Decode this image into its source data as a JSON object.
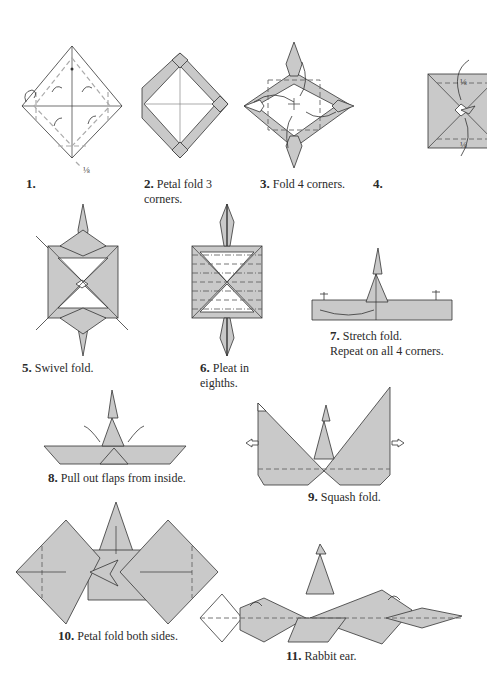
{
  "diagram": {
    "colors": {
      "paper_colored": "#c9c9c9",
      "paper_white": "#ffffff",
      "lines": "#333333"
    },
    "steps": [
      {
        "number": "1.",
        "text": "",
        "marks": [
          "1/8"
        ]
      },
      {
        "number": "2.",
        "text": "Petal fold 3 corners."
      },
      {
        "number": "3.",
        "text": "Fold 4 corners."
      },
      {
        "number": "4.",
        "text": "",
        "marks": [
          "1/8",
          "1/8"
        ]
      },
      {
        "number": "5.",
        "text": "Swivel fold."
      },
      {
        "number": "6.",
        "text": "Pleat in eighths."
      },
      {
        "number": "7.",
        "text": "Stretch fold.",
        "text2": "Repeat on all 4 corners."
      },
      {
        "number": "8.",
        "text": "Pull out flaps from inside."
      },
      {
        "number": "9.",
        "text": "Squash fold."
      },
      {
        "number": "10.",
        "text": "Petal fold both sides."
      },
      {
        "number": "11.",
        "text": "Rabbit ear."
      }
    ],
    "labels": {
      "s1_frac": "⅛",
      "s4_frac_top": "⅛",
      "s4_frac_bottom": "⅛",
      "s2_line1": "Petal fold 3",
      "s2_line2": "corners.",
      "s6_line1": "Pleat in",
      "s6_line2": "eighths."
    }
  }
}
